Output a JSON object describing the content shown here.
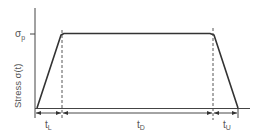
{
  "diagram": {
    "type": "trapezoidal-load-profile",
    "y_axis_label": "Stress σ(t)",
    "peak_label": "σ",
    "peak_subscript": "p",
    "segments": [
      {
        "name": "loading",
        "label": "t",
        "subscript": "L"
      },
      {
        "name": "dwell",
        "label": "t",
        "subscript": "D"
      },
      {
        "name": "unloading",
        "label": "t",
        "subscript": "U"
      }
    ],
    "colors": {
      "line": "#333333",
      "label": "#555555",
      "dashed": "#444444"
    }
  }
}
